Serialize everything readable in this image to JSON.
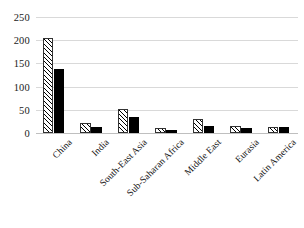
{
  "chart_data": {
    "type": "bar",
    "title": "",
    "subtitle": "",
    "xlabel": "",
    "ylabel": "",
    "ylim": [
      0,
      250
    ],
    "yticks": [
      "0",
      "50",
      "100",
      "150",
      "200",
      "250"
    ],
    "ytick_values": [
      0,
      50,
      100,
      150,
      200,
      250
    ],
    "grid": true,
    "legend": "none",
    "categories": [
      "China",
      "India",
      "South-East Asia",
      "Sub-Saharan Africa",
      "Middle East",
      "Eurasia",
      "Latin America"
    ],
    "series": [
      {
        "name": "series-1",
        "style": "hatched",
        "color": "#ffffff",
        "values": [
          205,
          22,
          52,
          10,
          30,
          15,
          12
        ]
      },
      {
        "name": "series-2",
        "style": "solid",
        "color": "#000000",
        "values": [
          138,
          14,
          34,
          6,
          15,
          11,
          13
        ]
      }
    ]
  }
}
